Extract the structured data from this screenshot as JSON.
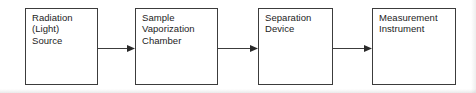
{
  "diagram": {
    "type": "flow-block-diagram",
    "orientation": "left-to-right",
    "background_color": "#ffffff",
    "stroke_color": "#3c3c3c",
    "text_color": "#1c1c1c",
    "blocks": [
      {
        "id": "radiation-source",
        "label": "Radiation\n(Light)\nSource",
        "lines": [
          "Radiation",
          "(Light)",
          "Source"
        ],
        "x": 25,
        "y": 8,
        "width": 73,
        "height": 77
      },
      {
        "id": "sample-vaporization-chamber",
        "label": "Sample\nVaporization\nChamber",
        "lines": [
          "Sample",
          "Vaporization",
          "Chamber"
        ],
        "x": 135,
        "y": 8,
        "width": 83,
        "height": 77
      },
      {
        "id": "separation-device",
        "label": "Separation\nDevice",
        "lines": [
          "Separation",
          "Device"
        ],
        "x": 258,
        "y": 8,
        "width": 75,
        "height": 77
      },
      {
        "id": "measurement-instrument",
        "label": "Measurement\nInstrument",
        "lines": [
          "Measurement",
          "Instrument"
        ],
        "x": 372,
        "y": 8,
        "width": 84,
        "height": 77
      }
    ],
    "connectors": [
      {
        "id": "arrow-source-to-chamber",
        "from": "radiation-source",
        "to": "sample-vaporization-chamber",
        "x": 98,
        "y": 44,
        "length": 37,
        "direction": "right"
      },
      {
        "id": "arrow-chamber-to-separation",
        "from": "sample-vaporization-chamber",
        "to": "separation-device",
        "x": 218,
        "y": 44,
        "length": 40,
        "direction": "right"
      },
      {
        "id": "arrow-separation-to-measurement",
        "from": "separation-device",
        "to": "measurement-instrument",
        "x": 333,
        "y": 44,
        "length": 39,
        "direction": "right"
      }
    ]
  }
}
